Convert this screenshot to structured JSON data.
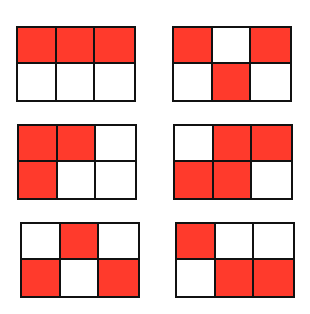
{
  "figure": {
    "colors": {
      "filled": "#ff3a2c",
      "empty": "#ffffff",
      "stroke": "#111111"
    },
    "grids": [
      {
        "id": "grid-1",
        "x": 16,
        "y": 26,
        "cells": [
          [
            1,
            1,
            1
          ],
          [
            0,
            0,
            0
          ]
        ],
        "filled_count": 3
      },
      {
        "id": "grid-2",
        "x": 172,
        "y": 26,
        "cells": [
          [
            1,
            0,
            1
          ],
          [
            0,
            1,
            0
          ]
        ],
        "filled_count": 3
      },
      {
        "id": "grid-3",
        "x": 17,
        "y": 124,
        "cells": [
          [
            1,
            1,
            0
          ],
          [
            1,
            0,
            0
          ]
        ],
        "filled_count": 3
      },
      {
        "id": "grid-4",
        "x": 173,
        "y": 124,
        "cells": [
          [
            0,
            1,
            1
          ],
          [
            1,
            1,
            0
          ]
        ],
        "filled_count": 4
      },
      {
        "id": "grid-5",
        "x": 20,
        "y": 222,
        "cells": [
          [
            0,
            1,
            0
          ],
          [
            1,
            0,
            1
          ]
        ],
        "filled_count": 3
      },
      {
        "id": "grid-6",
        "x": 175,
        "y": 222,
        "cells": [
          [
            1,
            0,
            0
          ],
          [
            0,
            1,
            1
          ]
        ],
        "filled_count": 3
      }
    ]
  }
}
